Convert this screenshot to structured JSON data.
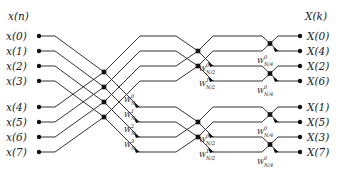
{
  "diagram": {
    "input_header": "x(n)",
    "output_header": "X(k)",
    "inputs": [
      "x(0)",
      "x(1)",
      "x(2)",
      "x(3)",
      "x(4)",
      "x(5)",
      "x(6)",
      "x(7)"
    ],
    "outputs": [
      "X(0)",
      "X(4)",
      "X(2)",
      "X(6)",
      "X(1)",
      "X(5)",
      "X(3)",
      "X(7)"
    ],
    "stage1_twiddles": [
      {
        "base": "W",
        "sub": "N",
        "sup": "0"
      },
      {
        "base": "W",
        "sub": "N",
        "sup": "1"
      },
      {
        "base": "W",
        "sub": "N",
        "sup": "2"
      },
      {
        "base": "W",
        "sub": "N",
        "sup": "3"
      }
    ],
    "stage2_twiddles": [
      {
        "base": "W",
        "sub": "N/2",
        "sup": "0"
      },
      {
        "base": "W",
        "sub": "N/2",
        "sup": "1"
      },
      {
        "base": "W",
        "sub": "N/2",
        "sup": "0"
      },
      {
        "base": "W",
        "sub": "N/2",
        "sup": "1"
      }
    ],
    "stage3_twiddles": [
      {
        "base": "W",
        "sub": "N/4",
        "sup": "0"
      },
      {
        "base": "W",
        "sub": "N/4",
        "sup": "0"
      },
      {
        "base": "W",
        "sub": "N/4",
        "sup": "0"
      },
      {
        "base": "W",
        "sub": "N/4",
        "sup": "0"
      }
    ]
  }
}
